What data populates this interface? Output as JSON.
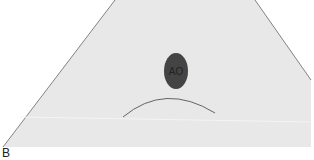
{
  "diagram": {
    "panel_label": "B",
    "structure_label": "AO",
    "colors": {
      "sector_fill": "#e8e8e8",
      "sector_stroke": "#666666",
      "vessel_fill": "#444444",
      "arc_stroke": "#555555"
    }
  }
}
